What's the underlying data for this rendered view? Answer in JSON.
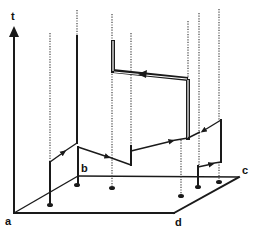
{
  "diagram": {
    "axis_label": "t",
    "corner_labels": {
      "a": "a",
      "b": "b",
      "c": "c",
      "d": "d"
    },
    "colors": {
      "ink": "#1a1a1a",
      "background": "#ffffff",
      "dotted": "#444444"
    }
  }
}
